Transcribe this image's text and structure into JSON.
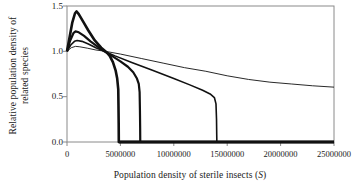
{
  "chart_data": {
    "type": "line",
    "title": "",
    "xlabel": "Population density of sterile insects (S)",
    "xlabel_plain": "Population density of sterile insects",
    "xlabel_symbol": "S",
    "ylabel_line1": "Relative population density of",
    "ylabel_line2": "related species",
    "xlim": [
      0,
      25000000
    ],
    "ylim": [
      0.0,
      1.5
    ],
    "grid": false,
    "legend": "none",
    "xticks": [
      0,
      5000000,
      10000000,
      15000000,
      20000000,
      25000000
    ],
    "xtick_labels": [
      "0",
      "5000000",
      "10000000",
      "15000000",
      "20000000",
      "25000000"
    ],
    "yticks": [
      0.0,
      0.5,
      1.0,
      1.5
    ],
    "ytick_labels": [
      "0.0",
      "0.5",
      "1.0",
      "1.5"
    ],
    "line_color": "#111111",
    "frame_color": "#8a8a8a",
    "series": [
      {
        "name": "curve-1-collapse-4.8M",
        "linewidth": 2.6,
        "points": [
          [
            0,
            1.0
          ],
          [
            250000,
            1.16
          ],
          [
            500000,
            1.32
          ],
          [
            750000,
            1.42
          ],
          [
            900000,
            1.44
          ],
          [
            1100000,
            1.41
          ],
          [
            1500000,
            1.33
          ],
          [
            2000000,
            1.23
          ],
          [
            2600000,
            1.12
          ],
          [
            3200000,
            1.04
          ],
          [
            3700000,
            0.99
          ],
          [
            4000000,
            0.95
          ],
          [
            4300000,
            0.88
          ],
          [
            4550000,
            0.79
          ],
          [
            4700000,
            0.7
          ],
          [
            4800000,
            0.58
          ],
          [
            4820000,
            0.4
          ],
          [
            4840000,
            0.2
          ],
          [
            4850000,
            0.0
          ],
          [
            25000000,
            0.0
          ]
        ]
      },
      {
        "name": "curve-2-collapse-6.8M",
        "linewidth": 2.2,
        "points": [
          [
            0,
            1.0
          ],
          [
            300000,
            1.12
          ],
          [
            600000,
            1.2
          ],
          [
            800000,
            1.22
          ],
          [
            1100000,
            1.21
          ],
          [
            1600000,
            1.17
          ],
          [
            2200000,
            1.11
          ],
          [
            2900000,
            1.05
          ],
          [
            3500000,
            1.0
          ],
          [
            4200000,
            0.95
          ],
          [
            5000000,
            0.89
          ],
          [
            5700000,
            0.83
          ],
          [
            6200000,
            0.77
          ],
          [
            6550000,
            0.7
          ],
          [
            6720000,
            0.64
          ],
          [
            6800000,
            0.55
          ],
          [
            6830000,
            0.35
          ],
          [
            6850000,
            0.15
          ],
          [
            6860000,
            0.0
          ],
          [
            25000000,
            0.0
          ]
        ]
      },
      {
        "name": "curve-3-collapse-14M",
        "linewidth": 1.6,
        "points": [
          [
            0,
            1.0
          ],
          [
            350000,
            1.07
          ],
          [
            700000,
            1.11
          ],
          [
            950000,
            1.12
          ],
          [
            1400000,
            1.11
          ],
          [
            2000000,
            1.08
          ],
          [
            2700000,
            1.04
          ],
          [
            3500000,
            1.0
          ],
          [
            4500000,
            0.95
          ],
          [
            6000000,
            0.88
          ],
          [
            8000000,
            0.79
          ],
          [
            10000000,
            0.7
          ],
          [
            11500000,
            0.63
          ],
          [
            12700000,
            0.57
          ],
          [
            13400000,
            0.53
          ],
          [
            13800000,
            0.49
          ],
          [
            13950000,
            0.42
          ],
          [
            14000000,
            0.25
          ],
          [
            14020000,
            0.08
          ],
          [
            14030000,
            0.0
          ],
          [
            25000000,
            0.0
          ]
        ]
      },
      {
        "name": "curve-4-persistent",
        "linewidth": 0.9,
        "points": [
          [
            0,
            1.0
          ],
          [
            400000,
            1.04
          ],
          [
            800000,
            1.055
          ],
          [
            1200000,
            1.05
          ],
          [
            1900000,
            1.035
          ],
          [
            2700000,
            1.015
          ],
          [
            3600000,
            1.0
          ],
          [
            5000000,
            0.97
          ],
          [
            7000000,
            0.92
          ],
          [
            9000000,
            0.87
          ],
          [
            11000000,
            0.82
          ],
          [
            13000000,
            0.78
          ],
          [
            15000000,
            0.73
          ],
          [
            17000000,
            0.69
          ],
          [
            19000000,
            0.66
          ],
          [
            21000000,
            0.64
          ],
          [
            23000000,
            0.62
          ],
          [
            25000000,
            0.605
          ]
        ]
      },
      {
        "name": "zero-baseline",
        "linewidth": 3.0,
        "points": [
          [
            4850000,
            0.0
          ],
          [
            25000000,
            0.0
          ]
        ]
      }
    ],
    "annotations": [
      "All curves begin at relative density 1.0 at S = 0",
      "Curves peak early then converge near (3.8e6, 1.0)",
      "Three curves collapse abruptly to 0 at approximately 4.8e6, 6.9e6 and 14.0e6",
      "Thinnest curve declines gradually to about 0.6 at S = 2.5e7"
    ]
  }
}
